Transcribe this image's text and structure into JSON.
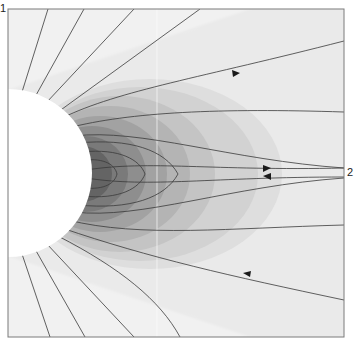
{
  "figure": {
    "type": "contour-streamline-diagram",
    "labels": {
      "top_left": "1",
      "right": "2"
    },
    "colors": {
      "background": "#f2f2f2",
      "frame": "#7a7a7a",
      "streamline": "#3a3a3a",
      "sphere": "#ffffff",
      "contour_levels": [
        "#ececec",
        "#e2e2e2",
        "#d2d2d2",
        "#c2c2c2",
        "#b0b0b0",
        "#9c9c9c",
        "#888888",
        "#727272",
        "#5e5e5e"
      ]
    },
    "arrows": [
      {
        "name": "upper-arrow",
        "direction": "right",
        "x": 236,
        "y": 73
      },
      {
        "name": "middle-upper-arrow",
        "direction": "right",
        "x": 267,
        "y": 168
      },
      {
        "name": "middle-lower-arrow",
        "direction": "left",
        "x": 267,
        "y": 176
      },
      {
        "name": "lower-arrow",
        "direction": "left",
        "x": 247,
        "y": 274
      }
    ]
  }
}
